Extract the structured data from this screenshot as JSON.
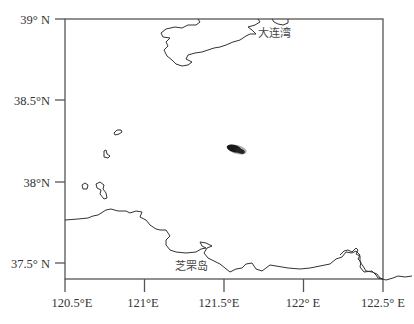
{
  "map": {
    "type": "map",
    "frame": {
      "x": 65,
      "y": 19,
      "width": 318,
      "height": 260
    },
    "extent": {
      "lon_min": 120.5,
      "lon_max": 122.5,
      "lat_min": 37.4,
      "lat_max": 39.0
    },
    "x_ticks": [
      {
        "value": 120.5,
        "label": "120.5°E"
      },
      {
        "value": 121.0,
        "label": "121°E"
      },
      {
        "value": 121.5,
        "label": "121.5°E"
      },
      {
        "value": 122.0,
        "label": "122° E"
      },
      {
        "value": 122.5,
        "label": "122.5° E"
      }
    ],
    "y_ticks": [
      {
        "value": 39.0,
        "label": "39° N"
      },
      {
        "value": 38.5,
        "label": "38.5°N"
      },
      {
        "value": 38.0,
        "label": "38°N"
      },
      {
        "value": 37.5,
        "label": "37.5° N"
      }
    ],
    "place_labels": [
      {
        "name": "大连湾",
        "lon": 121.72,
        "lat": 38.96
      },
      {
        "name": "芝罘岛",
        "lon": 121.32,
        "lat": 37.5
      }
    ],
    "features": {
      "north_coast": "Liaodong Peninsula coastline (top)",
      "south_coast": "Shandong Peninsula coastline (bottom)",
      "islands": "Miaodao archipelago islands (left)",
      "spill_blob": {
        "lon": 121.57,
        "lat": 38.2,
        "description": "dark elongated patch (oil spill / target)"
      }
    },
    "colors": {
      "frame": "#555555",
      "coast": "#333333",
      "blob": "#1a1a1a",
      "text": "#333333"
    }
  }
}
